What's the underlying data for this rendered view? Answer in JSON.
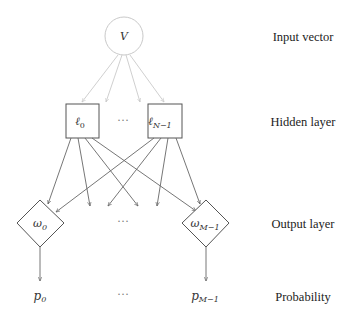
{
  "diagram": {
    "type": "neural-network-architecture",
    "colors": {
      "input_node_stroke": "#c9c9c9",
      "input_edges": "#c9c9c9",
      "node_stroke": "#555555",
      "edges": "#666666",
      "text": "#222222"
    },
    "layers": [
      {
        "id": "input",
        "label": "Input vector"
      },
      {
        "id": "hidden",
        "label": "Hidden layer"
      },
      {
        "id": "output",
        "label": "Output layer"
      },
      {
        "id": "probability",
        "label": "Probability"
      }
    ],
    "nodes": {
      "input": {
        "label": "V",
        "shape": "circle"
      },
      "hidden": [
        {
          "label": "ℓ",
          "sub": "0",
          "shape": "square"
        },
        {
          "label": "ℓ",
          "sub": "N−1",
          "shape": "square"
        }
      ],
      "hidden_ellipsis": "···",
      "output": [
        {
          "label": "ω",
          "sub": "0",
          "shape": "diamond"
        },
        {
          "label": "ω",
          "sub": "M−1",
          "shape": "diamond"
        }
      ],
      "output_ellipsis": "···",
      "probability": [
        {
          "label": "p",
          "sub": "0"
        },
        {
          "label": "p",
          "sub": "M−1"
        }
      ],
      "probability_ellipsis": "···"
    }
  }
}
